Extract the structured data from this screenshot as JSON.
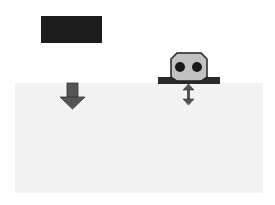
{
  "diagram": {
    "colors": {
      "background": "#ffffff",
      "ground": "#f3f3f3",
      "block": "#1c1c1c",
      "arrow": "#555555",
      "device_body": "#c2c2c2",
      "device_outline": "#222222",
      "device_eyes": "#1a1a1a",
      "plate": "#2a2a2a"
    },
    "elements": [
      {
        "name": "dark-block",
        "shape": "rectangle"
      },
      {
        "name": "ground-region",
        "shape": "rectangle"
      },
      {
        "name": "down-arrow",
        "shape": "arrow"
      },
      {
        "name": "sensor-device",
        "shape": "octagon-with-two-circles"
      },
      {
        "name": "base-plate",
        "shape": "bar"
      },
      {
        "name": "double-arrow",
        "shape": "vertical double-headed arrow"
      }
    ]
  }
}
